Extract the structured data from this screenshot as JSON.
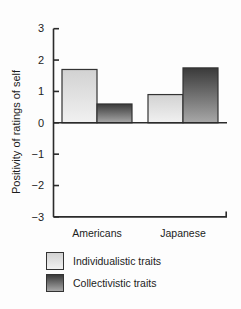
{
  "figure": {
    "background": "#fdfdfd",
    "axis_color": "#2b2b2b",
    "text_color": "#1c1c1c",
    "bar_outline_color": "#333333"
  },
  "chart_data": {
    "type": "bar",
    "title": "",
    "xlabel": "",
    "ylabel": "Positivity of ratings of self",
    "categories": [
      "Americans",
      "Japanese"
    ],
    "series": [
      {
        "name": "Individualistic traits",
        "values": [
          1.7,
          0.9
        ],
        "color_top": "#d2d2d2",
        "color_bottom": "#f1f1f1"
      },
      {
        "name": "Collectivistic traits",
        "values": [
          0.6,
          1.75
        ],
        "color_top": "#3a3a3a",
        "color_bottom": "#a8a8a8"
      }
    ],
    "ylim": [
      -3,
      3
    ],
    "yticks": [
      3,
      2,
      1,
      0,
      -1,
      -2,
      -3
    ],
    "grid": false,
    "legend_position": "bottom-left"
  }
}
